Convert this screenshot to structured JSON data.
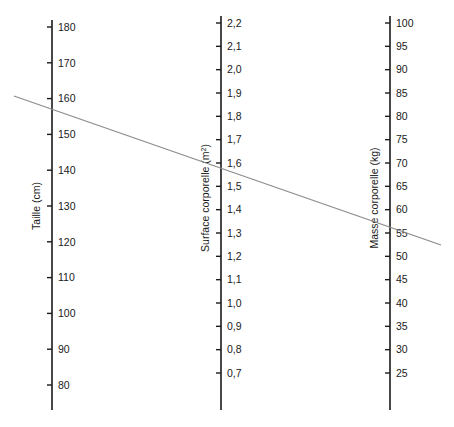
{
  "chart_data": {
    "type": "line",
    "chart_kind": "nomogram",
    "title": "",
    "subtitle": "",
    "xlabel": "",
    "ylabel": "",
    "grid": false,
    "legend": false,
    "background_color": "#ffffff",
    "axis_color": "#1a1a1a",
    "line_color": "#8c8c8c",
    "axes": [
      {
        "id": "taille",
        "title": "Taille (cm)",
        "units": "cm",
        "x_px": 52,
        "range": [
          80,
          180
        ],
        "tick_step": 10,
        "tick_labels": [
          "180",
          "170",
          "160",
          "150",
          "140",
          "130",
          "120",
          "110",
          "100",
          "90",
          "80"
        ],
        "tick_values": [
          180,
          170,
          160,
          150,
          140,
          130,
          120,
          110,
          100,
          90,
          80
        ],
        "top_px": 27,
        "bottom_px": 385,
        "spine_top_px": 20,
        "spine_bottom_px": 410
      },
      {
        "id": "surface-corporelle",
        "title": "Surface corporelle (m",
        "title_sup": "2",
        "title_suffix": ")",
        "units": "m2",
        "x_px": 221,
        "range": [
          0.7,
          2.2
        ],
        "tick_step": 0.1,
        "tick_labels": [
          "2,2",
          "2,1",
          "2,0",
          "1,9",
          "1,8",
          "1,7",
          "1,6",
          "1,5",
          "1,4",
          "1,3",
          "1,2",
          "1,1",
          "1,0",
          "0,9",
          "0,8",
          "0,7"
        ],
        "tick_values": [
          2.2,
          2.1,
          2.0,
          1.9,
          1.8,
          1.7,
          1.6,
          1.5,
          1.4,
          1.3,
          1.2,
          1.1,
          1.0,
          0.9,
          0.8,
          0.7
        ],
        "top_px": 23,
        "bottom_px": 373,
        "spine_top_px": 16,
        "spine_bottom_px": 410
      },
      {
        "id": "masse-corporelle",
        "title": "Masse corporelle (kg)",
        "units": "kg",
        "x_px": 390,
        "range": [
          25,
          100
        ],
        "tick_step": 5,
        "tick_labels": [
          "100",
          "95",
          "90",
          "85",
          "80",
          "75",
          "70",
          "65",
          "60",
          "55",
          "50",
          "45",
          "40",
          "35",
          "30",
          "25"
        ],
        "tick_values": [
          100,
          95,
          90,
          85,
          80,
          75,
          70,
          65,
          60,
          55,
          50,
          45,
          40,
          35,
          30,
          25
        ],
        "top_px": 23,
        "bottom_px": 373,
        "spine_top_px": 16,
        "spine_bottom_px": 410
      }
    ],
    "isopleth": {
      "label": "ligne de lecture",
      "x1_px": 14,
      "y1_px": 96,
      "x2_px": 441,
      "y2_px": 245,
      "readings": {
        "taille_cm": 150,
        "surface_corporelle_m2": 1.35,
        "masse_corporelle_kg": 45
      }
    }
  }
}
